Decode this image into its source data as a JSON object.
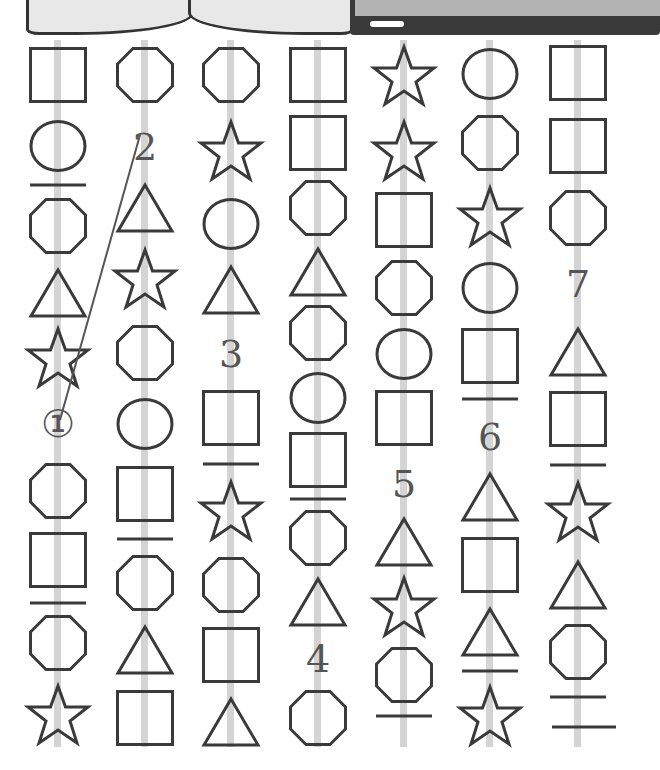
{
  "header": {
    "book_caption": "(ㅁㅁ  ㅁㅁ ㅁ)",
    "panel": "dark-panel-with-white-pill"
  },
  "colors": {
    "stroke": "#3a3a3a",
    "rail": "#d4d4d4",
    "number": "#555555"
  },
  "columns": [
    {
      "x": 18,
      "items": [
        {
          "type": "square",
          "top": 7
        },
        {
          "type": "circle",
          "top": 80
        },
        {
          "type": "line",
          "top": 143
        },
        {
          "type": "octagon",
          "top": 158
        },
        {
          "type": "triangle",
          "top": 228
        },
        {
          "type": "star",
          "top": 287
        },
        {
          "type": "number",
          "value": "①",
          "top": 365
        },
        {
          "type": "octagon",
          "top": 423
        },
        {
          "type": "square",
          "top": 492
        },
        {
          "type": "line",
          "top": 561
        },
        {
          "type": "octagon",
          "top": 575
        },
        {
          "type": "star",
          "top": 644
        }
      ]
    },
    {
      "x": 105,
      "items": [
        {
          "type": "octagon",
          "top": 7
        },
        {
          "type": "number",
          "value": "2",
          "top": 88
        },
        {
          "type": "triangle",
          "top": 143
        },
        {
          "type": "star",
          "top": 208
        },
        {
          "type": "octagon",
          "top": 285
        },
        {
          "type": "circle",
          "top": 358
        },
        {
          "type": "square",
          "top": 426
        },
        {
          "type": "line",
          "top": 497
        },
        {
          "type": "octagon",
          "top": 515
        },
        {
          "type": "triangle",
          "top": 585
        },
        {
          "type": "square",
          "top": 650
        }
      ]
    },
    {
      "x": 191,
      "items": [
        {
          "type": "octagon",
          "top": 7
        },
        {
          "type": "star",
          "top": 80
        },
        {
          "type": "circle",
          "top": 158
        },
        {
          "type": "triangle",
          "top": 225
        },
        {
          "type": "number",
          "value": "3",
          "top": 295
        },
        {
          "type": "square",
          "top": 350
        },
        {
          "type": "line",
          "top": 422
        },
        {
          "type": "star",
          "top": 440
        },
        {
          "type": "octagon",
          "top": 517
        },
        {
          "type": "square",
          "top": 587
        },
        {
          "type": "triangle",
          "top": 657
        }
      ]
    },
    {
      "x": 278,
      "items": [
        {
          "type": "square",
          "top": 7
        },
        {
          "type": "square",
          "top": 75
        },
        {
          "type": "octagon",
          "top": 140
        },
        {
          "type": "triangle",
          "top": 207
        },
        {
          "type": "octagon",
          "top": 265
        },
        {
          "type": "circle",
          "top": 332
        },
        {
          "type": "square",
          "top": 392
        },
        {
          "type": "line",
          "top": 457
        },
        {
          "type": "octagon",
          "top": 470
        },
        {
          "type": "triangle",
          "top": 537
        },
        {
          "type": "number",
          "value": "4",
          "top": 600
        },
        {
          "type": "octagon",
          "top": 650
        }
      ]
    },
    {
      "x": 364,
      "items": [
        {
          "type": "star",
          "top": 5
        },
        {
          "type": "star",
          "top": 80
        },
        {
          "type": "square",
          "top": 152
        },
        {
          "type": "octagon",
          "top": 220
        },
        {
          "type": "circle",
          "top": 288
        },
        {
          "type": "square",
          "top": 350
        },
        {
          "type": "number",
          "value": "5",
          "top": 425
        },
        {
          "type": "triangle",
          "top": 477
        },
        {
          "type": "star",
          "top": 536
        },
        {
          "type": "octagon",
          "top": 607
        },
        {
          "type": "line",
          "top": 674
        }
      ]
    },
    {
      "x": 450,
      "items": [
        {
          "type": "circle",
          "top": 8
        },
        {
          "type": "octagon",
          "top": 75
        },
        {
          "type": "star",
          "top": 146
        },
        {
          "type": "circle",
          "top": 222
        },
        {
          "type": "square",
          "top": 288
        },
        {
          "type": "line",
          "top": 357
        },
        {
          "type": "number",
          "value": "6",
          "top": 378
        },
        {
          "type": "triangle",
          "top": 432
        },
        {
          "type": "square",
          "top": 497
        },
        {
          "type": "triangle",
          "top": 567
        },
        {
          "type": "line",
          "top": 629
        },
        {
          "type": "star",
          "top": 645
        }
      ]
    },
    {
      "x": 538,
      "items": [
        {
          "type": "square",
          "top": 5
        },
        {
          "type": "square",
          "top": 78
        },
        {
          "type": "octagon",
          "top": 150
        },
        {
          "type": "number",
          "value": "7",
          "top": 225
        },
        {
          "type": "triangle",
          "top": 287
        },
        {
          "type": "square",
          "top": 351
        },
        {
          "type": "line",
          "top": 423
        },
        {
          "type": "star",
          "top": 441
        },
        {
          "type": "triangle",
          "top": 520
        },
        {
          "type": "octagon",
          "top": 584
        },
        {
          "type": "line",
          "top": 655
        },
        {
          "type": "line-wide",
          "top": 685
        }
      ]
    }
  ],
  "connector": {
    "from": [
      60,
      420
    ],
    "to": [
      140,
      135
    ]
  }
}
